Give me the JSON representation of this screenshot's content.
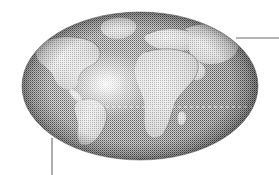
{
  "figure": {
    "name": "world-globe-illustration",
    "background_color": "#ffffff",
    "width": 279,
    "height": 175,
    "alt_text": "Halftone grayscale illustration of the Earth as an ellipse showing the Americas at left and Europe and Africa at center-right, with two thin callout leader lines."
  },
  "globe": {
    "name": "earth-globe",
    "shape": "ellipse",
    "center_x": 140,
    "center_y": 86,
    "radius_x": 118,
    "radius_y": 74,
    "bounds": {
      "left": 22,
      "top": 12,
      "right": 258,
      "bottom": 160
    },
    "ocean_color_light": "#b8b8b8",
    "ocean_color_mid": "#9a9a9a",
    "ocean_color_dark": "#6e6e6e",
    "land_color_light": "#e2e2e2",
    "land_color_mid": "#c9c9c9",
    "edge_color": "#5a5a5a",
    "texture": "halftone-dither",
    "highlight": {
      "name": "specular-highlight",
      "center_x": 106,
      "center_y": 84,
      "radius": 40,
      "color": "#f6f6f6"
    }
  },
  "equator": {
    "name": "equator-dashed-line",
    "y": 107,
    "x_start": 88,
    "x_end": 252,
    "color": "#f0f0f0",
    "dash": "3 3",
    "width": 1
  },
  "landmasses": [
    {
      "name": "north-america",
      "label": "North America"
    },
    {
      "name": "south-america",
      "label": "South America"
    },
    {
      "name": "greenland",
      "label": "Greenland"
    },
    {
      "name": "europe",
      "label": "Europe"
    },
    {
      "name": "africa",
      "label": "Africa"
    },
    {
      "name": "asia",
      "label": "Asia"
    }
  ],
  "callouts": [
    {
      "name": "callout-line-upper-right",
      "orientation": "horizontal",
      "x_start": 236,
      "y_start": 38,
      "x_end": 279,
      "y_end": 38,
      "color": "#6b6b6b",
      "width": 1
    },
    {
      "name": "callout-line-lower-left",
      "orientation": "vertical",
      "x_start": 52,
      "y_start": 138,
      "x_end": 52,
      "y_end": 175,
      "color": "#6b6b6b",
      "width": 1
    }
  ]
}
